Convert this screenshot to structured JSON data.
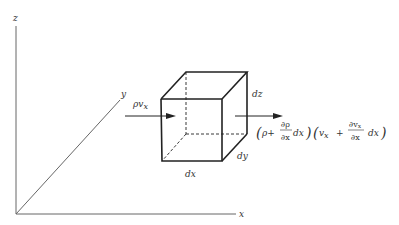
{
  "diagram": {
    "type": "control-volume-mass-flux",
    "axes": {
      "z_label": "z",
      "y_label": "y",
      "x_label": "x"
    },
    "cube": {
      "dims": {
        "dx": "dx",
        "dy": "dy",
        "dz": "dz"
      }
    },
    "inflow": {
      "label_main": "ρv",
      "label_sub": "x"
    },
    "outflow": {
      "term1_open": "(",
      "term1_p": "ρ+",
      "term1_num": "∂ρ",
      "term1_den": "∂x",
      "term1_dx": "dx",
      "term1_close": ")",
      "term2_open": "(",
      "term2_v": "v",
      "term2_vsub": "x",
      "term2_plus": "+",
      "term2_num": "∂v",
      "term2_numsub": "x",
      "term2_den": "∂x",
      "term2_dx": "dx",
      "term2_close": ")"
    },
    "colors": {
      "line": "#2a2a2a",
      "axis": "#555555"
    }
  }
}
